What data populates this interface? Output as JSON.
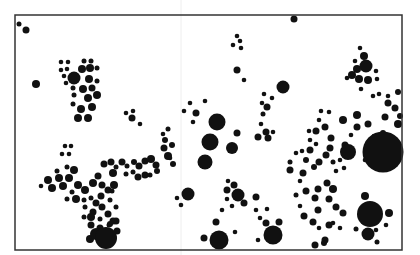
{
  "figure": {
    "type": "proportional-dot-map",
    "background": "#ffffff",
    "ink": "#111111",
    "frame": {
      "x": 15,
      "y": 15,
      "width": 387,
      "height": 235,
      "stroke": "#333333",
      "stroke_width": 1.5
    },
    "fold_line": {
      "x": 181,
      "color": "#eeeeee"
    }
  },
  "dots": [
    {
      "x": 19,
      "y": 24,
      "r": 2.5
    },
    {
      "x": 26,
      "y": 30,
      "r": 3.5
    },
    {
      "x": 36,
      "y": 84,
      "r": 4
    },
    {
      "x": 294,
      "y": 19,
      "r": 3.5
    },
    {
      "x": 61,
      "y": 62,
      "r": 2.3
    },
    {
      "x": 68,
      "y": 62,
      "r": 2.3
    },
    {
      "x": 61,
      "y": 70,
      "r": 2.3
    },
    {
      "x": 67,
      "y": 69,
      "r": 2.3
    },
    {
      "x": 74,
      "y": 78,
      "r": 6.5
    },
    {
      "x": 64,
      "y": 76,
      "r": 2.3
    },
    {
      "x": 66,
      "y": 83,
      "r": 2.3
    },
    {
      "x": 82,
      "y": 69,
      "r": 4
    },
    {
      "x": 84,
      "y": 61,
      "r": 2.5
    },
    {
      "x": 91,
      "y": 61,
      "r": 2.5
    },
    {
      "x": 90,
      "y": 68,
      "r": 4
    },
    {
      "x": 97,
      "y": 68,
      "r": 2.5
    },
    {
      "x": 89,
      "y": 79,
      "r": 4
    },
    {
      "x": 97,
      "y": 81,
      "r": 2.5
    },
    {
      "x": 83,
      "y": 89,
      "r": 4
    },
    {
      "x": 92,
      "y": 88,
      "r": 3.5
    },
    {
      "x": 73,
      "y": 88,
      "r": 2.5
    },
    {
      "x": 74,
      "y": 95,
      "r": 2.5
    },
    {
      "x": 88,
      "y": 98,
      "r": 4
    },
    {
      "x": 97,
      "y": 95,
      "r": 4
    },
    {
      "x": 73,
      "y": 104,
      "r": 2.5
    },
    {
      "x": 81,
      "y": 109,
      "r": 4
    },
    {
      "x": 92,
      "y": 107,
      "r": 4
    },
    {
      "x": 78,
      "y": 118,
      "r": 4
    },
    {
      "x": 88,
      "y": 118,
      "r": 4
    },
    {
      "x": 126,
      "y": 113,
      "r": 2.3
    },
    {
      "x": 133,
      "y": 111,
      "r": 2.3
    },
    {
      "x": 132,
      "y": 118,
      "r": 3.5
    },
    {
      "x": 140,
      "y": 124,
      "r": 2.3
    },
    {
      "x": 237,
      "y": 36,
      "r": 2.3
    },
    {
      "x": 240,
      "y": 41,
      "r": 2.3
    },
    {
      "x": 233,
      "y": 45,
      "r": 2.3
    },
    {
      "x": 241,
      "y": 48,
      "r": 2.3
    },
    {
      "x": 237,
      "y": 70,
      "r": 3.5
    },
    {
      "x": 244,
      "y": 80,
      "r": 2.3
    },
    {
      "x": 283,
      "y": 87,
      "r": 6.5
    },
    {
      "x": 264,
      "y": 94,
      "r": 2.3
    },
    {
      "x": 272,
      "y": 98,
      "r": 2.3
    },
    {
      "x": 262,
      "y": 103,
      "r": 2.3
    },
    {
      "x": 267,
      "y": 107,
      "r": 3.5
    },
    {
      "x": 263,
      "y": 114,
      "r": 2.5
    },
    {
      "x": 261,
      "y": 124,
      "r": 2.3
    },
    {
      "x": 266,
      "y": 132,
      "r": 3.5
    },
    {
      "x": 273,
      "y": 132,
      "r": 2.3
    },
    {
      "x": 258,
      "y": 137,
      "r": 3.5
    },
    {
      "x": 268,
      "y": 138,
      "r": 3.5
    },
    {
      "x": 190,
      "y": 103,
      "r": 2.3
    },
    {
      "x": 205,
      "y": 101,
      "r": 2.3
    },
    {
      "x": 184,
      "y": 111,
      "r": 2.3
    },
    {
      "x": 196,
      "y": 113,
      "r": 3.5
    },
    {
      "x": 193,
      "y": 122,
      "r": 2.3
    },
    {
      "x": 217,
      "y": 122,
      "r": 8.5
    },
    {
      "x": 237,
      "y": 133,
      "r": 3.5
    },
    {
      "x": 210,
      "y": 142,
      "r": 8.5
    },
    {
      "x": 232,
      "y": 148,
      "r": 6
    },
    {
      "x": 205,
      "y": 162,
      "r": 7.5
    },
    {
      "x": 172,
      "y": 145,
      "r": 3
    },
    {
      "x": 170,
      "y": 158,
      "r": 2.3
    },
    {
      "x": 173,
      "y": 164,
      "r": 3
    },
    {
      "x": 163,
      "y": 134,
      "r": 2.3
    },
    {
      "x": 168,
      "y": 129,
      "r": 2.5
    },
    {
      "x": 164,
      "y": 148,
      "r": 3.5
    },
    {
      "x": 168,
      "y": 156,
      "r": 4
    },
    {
      "x": 165,
      "y": 140,
      "r": 3
    },
    {
      "x": 65,
      "y": 146,
      "r": 2.3
    },
    {
      "x": 71,
      "y": 146,
      "r": 2.3
    },
    {
      "x": 62,
      "y": 154,
      "r": 2.3
    },
    {
      "x": 69,
      "y": 154,
      "r": 2.3
    },
    {
      "x": 41,
      "y": 186,
      "r": 2.3
    },
    {
      "x": 48,
      "y": 180,
      "r": 4
    },
    {
      "x": 52,
      "y": 188,
      "r": 4
    },
    {
      "x": 57,
      "y": 171,
      "r": 2.5
    },
    {
      "x": 59,
      "y": 178,
      "r": 4
    },
    {
      "x": 63,
      "y": 186,
      "r": 4
    },
    {
      "x": 69,
      "y": 178,
      "r": 4
    },
    {
      "x": 74,
      "y": 170,
      "r": 4
    },
    {
      "x": 67,
      "y": 167,
      "r": 2.5
    },
    {
      "x": 78,
      "y": 185,
      "r": 4
    },
    {
      "x": 72,
      "y": 192,
      "r": 2.5
    },
    {
      "x": 67,
      "y": 199,
      "r": 2.5
    },
    {
      "x": 76,
      "y": 199,
      "r": 4
    },
    {
      "x": 85,
      "y": 190,
      "r": 4
    },
    {
      "x": 93,
      "y": 183,
      "r": 4
    },
    {
      "x": 98,
      "y": 176,
      "r": 3.5
    },
    {
      "x": 102,
      "y": 185,
      "r": 3.5
    },
    {
      "x": 108,
      "y": 190,
      "r": 3.5
    },
    {
      "x": 114,
      "y": 185,
      "r": 4
    },
    {
      "x": 113,
      "y": 173,
      "r": 4
    },
    {
      "x": 104,
      "y": 164,
      "r": 3.5
    },
    {
      "x": 111,
      "y": 162,
      "r": 3.5
    },
    {
      "x": 116,
      "y": 167,
      "r": 2.5
    },
    {
      "x": 122,
      "y": 162,
      "r": 3.5
    },
    {
      "x": 127,
      "y": 166,
      "r": 2.5
    },
    {
      "x": 134,
      "y": 162,
      "r": 3
    },
    {
      "x": 139,
      "y": 166,
      "r": 3.5
    },
    {
      "x": 145,
      "y": 161,
      "r": 3.5
    },
    {
      "x": 151,
      "y": 159,
      "r": 4
    },
    {
      "x": 156,
      "y": 165,
      "r": 3.5
    },
    {
      "x": 126,
      "y": 174,
      "r": 2.5
    },
    {
      "x": 133,
      "y": 172,
      "r": 2.5
    },
    {
      "x": 138,
      "y": 177,
      "r": 3.5
    },
    {
      "x": 145,
      "y": 175,
      "r": 3.5
    },
    {
      "x": 150,
      "y": 175,
      "r": 2.5
    },
    {
      "x": 157,
      "y": 171,
      "r": 3
    },
    {
      "x": 91,
      "y": 198,
      "r": 2.5
    },
    {
      "x": 96,
      "y": 203,
      "r": 3.5
    },
    {
      "x": 101,
      "y": 196,
      "r": 3.5
    },
    {
      "x": 84,
      "y": 200,
      "r": 2.5
    },
    {
      "x": 85,
      "y": 207,
      "r": 2.5
    },
    {
      "x": 93,
      "y": 212,
      "r": 3.5
    },
    {
      "x": 102,
      "y": 207,
      "r": 3.5
    },
    {
      "x": 108,
      "y": 214,
      "r": 3.5
    },
    {
      "x": 116,
      "y": 207,
      "r": 2.5
    },
    {
      "x": 110,
      "y": 200,
      "r": 2.5
    },
    {
      "x": 112,
      "y": 191,
      "r": 2.5
    },
    {
      "x": 100,
      "y": 219,
      "r": 2.5
    },
    {
      "x": 91,
      "y": 225,
      "r": 3.5
    },
    {
      "x": 100,
      "y": 228,
      "r": 3.5
    },
    {
      "x": 109,
      "y": 225,
      "r": 2.5
    },
    {
      "x": 116,
      "y": 221,
      "r": 3.5
    },
    {
      "x": 84,
      "y": 217,
      "r": 2.5
    },
    {
      "x": 91,
      "y": 217,
      "r": 4
    },
    {
      "x": 90,
      "y": 239,
      "r": 4
    },
    {
      "x": 96,
      "y": 234,
      "r": 6
    },
    {
      "x": 106,
      "y": 238,
      "r": 11
    },
    {
      "x": 110,
      "y": 224,
      "r": 3
    },
    {
      "x": 117,
      "y": 231,
      "r": 3.5
    },
    {
      "x": 113,
      "y": 221,
      "r": 3.5
    },
    {
      "x": 188,
      "y": 194,
      "r": 6.5
    },
    {
      "x": 177,
      "y": 198,
      "r": 2.3
    },
    {
      "x": 181,
      "y": 205,
      "r": 2.3
    },
    {
      "x": 228,
      "y": 181,
      "r": 2.3
    },
    {
      "x": 234,
      "y": 185,
      "r": 3.5
    },
    {
      "x": 227,
      "y": 190,
      "r": 3.5
    },
    {
      "x": 238,
      "y": 195,
      "r": 6.5
    },
    {
      "x": 227,
      "y": 199,
      "r": 2.3
    },
    {
      "x": 232,
      "y": 206,
      "r": 2.3
    },
    {
      "x": 244,
      "y": 203,
      "r": 3.5
    },
    {
      "x": 222,
      "y": 210,
      "r": 2.3
    },
    {
      "x": 256,
      "y": 197,
      "r": 3.5
    },
    {
      "x": 256,
      "y": 210,
      "r": 2.3
    },
    {
      "x": 267,
      "y": 209,
      "r": 2.3
    },
    {
      "x": 260,
      "y": 218,
      "r": 2.3
    },
    {
      "x": 266,
      "y": 223,
      "r": 3.5
    },
    {
      "x": 279,
      "y": 222,
      "r": 3.5
    },
    {
      "x": 273,
      "y": 235,
      "r": 9.5
    },
    {
      "x": 258,
      "y": 240,
      "r": 2.3
    },
    {
      "x": 216,
      "y": 222,
      "r": 3.5
    },
    {
      "x": 235,
      "y": 232,
      "r": 2.3
    },
    {
      "x": 219,
      "y": 240,
      "r": 9.5
    },
    {
      "x": 204,
      "y": 238,
      "r": 3.5
    },
    {
      "x": 360,
      "y": 48,
      "r": 2.3
    },
    {
      "x": 364,
      "y": 56,
      "r": 4
    },
    {
      "x": 355,
      "y": 61,
      "r": 2.3
    },
    {
      "x": 357,
      "y": 69,
      "r": 4
    },
    {
      "x": 366,
      "y": 66,
      "r": 6.5
    },
    {
      "x": 352,
      "y": 75,
      "r": 4
    },
    {
      "x": 359,
      "y": 79,
      "r": 4
    },
    {
      "x": 368,
      "y": 80,
      "r": 4
    },
    {
      "x": 376,
      "y": 71,
      "r": 2.3
    },
    {
      "x": 377,
      "y": 79,
      "r": 2.3
    },
    {
      "x": 347,
      "y": 78,
      "r": 2.3
    },
    {
      "x": 361,
      "y": 89,
      "r": 2.3
    },
    {
      "x": 379,
      "y": 94,
      "r": 2.3
    },
    {
      "x": 388,
      "y": 96,
      "r": 2.3
    },
    {
      "x": 398,
      "y": 92,
      "r": 3
    },
    {
      "x": 373,
      "y": 96,
      "r": 2.3
    },
    {
      "x": 321,
      "y": 111,
      "r": 2.3
    },
    {
      "x": 329,
      "y": 112,
      "r": 2.3
    },
    {
      "x": 319,
      "y": 120,
      "r": 2.3
    },
    {
      "x": 325,
      "y": 127,
      "r": 3.5
    },
    {
      "x": 316,
      "y": 131,
      "r": 3.5
    },
    {
      "x": 331,
      "y": 138,
      "r": 3.5
    },
    {
      "x": 309,
      "y": 131,
      "r": 2.3
    },
    {
      "x": 316,
      "y": 144,
      "r": 2.3
    },
    {
      "x": 302,
      "y": 151,
      "r": 2.3
    },
    {
      "x": 310,
      "y": 150,
      "r": 3.5
    },
    {
      "x": 326,
      "y": 155,
      "r": 3.5
    },
    {
      "x": 345,
      "y": 145,
      "r": 3.5
    },
    {
      "x": 343,
      "y": 120,
      "r": 4
    },
    {
      "x": 357,
      "y": 115,
      "r": 4
    },
    {
      "x": 351,
      "y": 135,
      "r": 2.3
    },
    {
      "x": 357,
      "y": 127,
      "r": 3.5
    },
    {
      "x": 368,
      "y": 124,
      "r": 3.5
    },
    {
      "x": 388,
      "y": 103,
      "r": 3.5
    },
    {
      "x": 385,
      "y": 117,
      "r": 3.5
    },
    {
      "x": 395,
      "y": 108,
      "r": 3.5
    },
    {
      "x": 398,
      "y": 124,
      "r": 4
    },
    {
      "x": 400,
      "y": 116,
      "r": 3
    },
    {
      "x": 374,
      "y": 136,
      "r": 2.3
    },
    {
      "x": 383,
      "y": 133,
      "r": 3
    },
    {
      "x": 310,
      "y": 140,
      "r": 2.3
    },
    {
      "x": 306,
      "y": 160,
      "r": 3
    },
    {
      "x": 319,
      "y": 162,
      "r": 3.5
    },
    {
      "x": 333,
      "y": 162,
      "r": 2.5
    },
    {
      "x": 336,
      "y": 171,
      "r": 2.3
    },
    {
      "x": 340,
      "y": 160,
      "r": 2.3
    },
    {
      "x": 348,
      "y": 152,
      "r": 8
    },
    {
      "x": 344,
      "y": 168,
      "r": 2.3
    },
    {
      "x": 372,
      "y": 146,
      "r": 3
    },
    {
      "x": 383,
      "y": 152,
      "r": 20.5
    },
    {
      "x": 365,
      "y": 160,
      "r": 2.3
    },
    {
      "x": 330,
      "y": 148,
      "r": 3.5
    },
    {
      "x": 296,
      "y": 153,
      "r": 2.3
    },
    {
      "x": 290,
      "y": 162,
      "r": 2.5
    },
    {
      "x": 314,
      "y": 167,
      "r": 3
    },
    {
      "x": 303,
      "y": 173,
      "r": 3.5
    },
    {
      "x": 300,
      "y": 181,
      "r": 2.3
    },
    {
      "x": 290,
      "y": 170,
      "r": 3.5
    },
    {
      "x": 327,
      "y": 183,
      "r": 3.5
    },
    {
      "x": 306,
      "y": 191,
      "r": 3.5
    },
    {
      "x": 318,
      "y": 189,
      "r": 3.5
    },
    {
      "x": 333,
      "y": 189,
      "r": 4
    },
    {
      "x": 315,
      "y": 198,
      "r": 3.5
    },
    {
      "x": 329,
      "y": 199,
      "r": 3.5
    },
    {
      "x": 318,
      "y": 210,
      "r": 3.5
    },
    {
      "x": 336,
      "y": 207,
      "r": 3.5
    },
    {
      "x": 304,
      "y": 216,
      "r": 3.5
    },
    {
      "x": 313,
      "y": 222,
      "r": 3.5
    },
    {
      "x": 329,
      "y": 225,
      "r": 3.5
    },
    {
      "x": 343,
      "y": 213,
      "r": 3.5
    },
    {
      "x": 319,
      "y": 228,
      "r": 2.3
    },
    {
      "x": 325,
      "y": 240,
      "r": 3.5
    },
    {
      "x": 315,
      "y": 245,
      "r": 3.5
    },
    {
      "x": 333,
      "y": 223,
      "r": 2.3
    },
    {
      "x": 340,
      "y": 228,
      "r": 2.3
    },
    {
      "x": 365,
      "y": 196,
      "r": 4
    },
    {
      "x": 370,
      "y": 214,
      "r": 13
    },
    {
      "x": 389,
      "y": 213,
      "r": 4
    },
    {
      "x": 386,
      "y": 225,
      "r": 2.3
    },
    {
      "x": 376,
      "y": 230,
      "r": 2.3
    },
    {
      "x": 368,
      "y": 234,
      "r": 6.5
    },
    {
      "x": 356,
      "y": 229,
      "r": 2.5
    },
    {
      "x": 377,
      "y": 242,
      "r": 2.5
    },
    {
      "x": 296,
      "y": 195,
      "r": 2.5
    },
    {
      "x": 300,
      "y": 206,
      "r": 2.3
    },
    {
      "x": 324,
      "y": 243,
      "r": 3
    }
  ]
}
